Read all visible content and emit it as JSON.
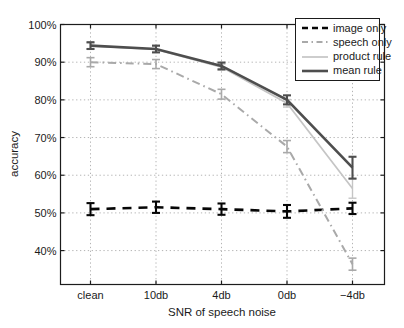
{
  "chart_data": {
    "type": "line",
    "title": "",
    "xlabel": "SNR of speech noise",
    "ylabel": "accuracy",
    "categories": [
      "clean",
      "10db",
      "4db",
      "0db",
      "−4db"
    ],
    "yticks": [
      100,
      90,
      80,
      70,
      60,
      50,
      40
    ],
    "ytick_labels": [
      "100%",
      "90%",
      "80%",
      "70%",
      "60%",
      "50%",
      "40%"
    ],
    "ylim": [
      31,
      100
    ],
    "grid": "dotted",
    "legend_position": "top-right",
    "background": "#ffffff",
    "axis_color": "#1c1c1c",
    "grid_color": "#b4b4b4",
    "series": [
      {
        "name": "image only",
        "color": "#060606",
        "line_style": "dashed",
        "line_width": 2.6,
        "values": [
          51.0,
          51.5,
          51.0,
          50.4,
          51.2
        ],
        "errors": [
          1.6,
          1.5,
          1.5,
          1.7,
          1.5
        ]
      },
      {
        "name": "speech only",
        "color": "#a9a9a9",
        "line_style": "dashdot",
        "line_width": 2.0,
        "values": [
          90.0,
          89.5,
          81.5,
          67.6,
          36.4
        ],
        "errors": [
          1.2,
          1.2,
          1.3,
          1.6,
          1.6
        ]
      },
      {
        "name": "product rule",
        "color": "#c5c5c5",
        "line_style": "solid",
        "line_width": 1.7,
        "values": [
          94.3,
          93.4,
          88.7,
          79.1,
          56.5
        ],
        "errors": [
          0.8,
          0.8,
          0.8,
          1.0,
          2.6
        ]
      },
      {
        "name": "mean rule",
        "color": "#4e4e4e",
        "line_style": "solid",
        "line_width": 2.6,
        "values": [
          94.4,
          93.5,
          89.0,
          80.0,
          62.0
        ],
        "errors": [
          0.9,
          0.9,
          0.9,
          1.2,
          2.9
        ]
      }
    ]
  }
}
